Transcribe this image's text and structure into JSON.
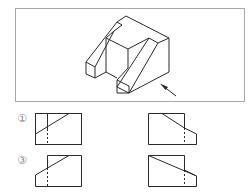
{
  "question": {
    "view_direction_arrow": "arrow-icon",
    "options": [
      {
        "label": "①",
        "position": "top-left"
      },
      {
        "label": "",
        "position": "top-right"
      },
      {
        "label": "③",
        "position": "bottom-left"
      },
      {
        "label": "",
        "position": "bottom-right"
      }
    ]
  },
  "colors": {
    "line": "#2a2a2a",
    "frame": "#a8a8a8",
    "label": "#8a8a8a"
  }
}
